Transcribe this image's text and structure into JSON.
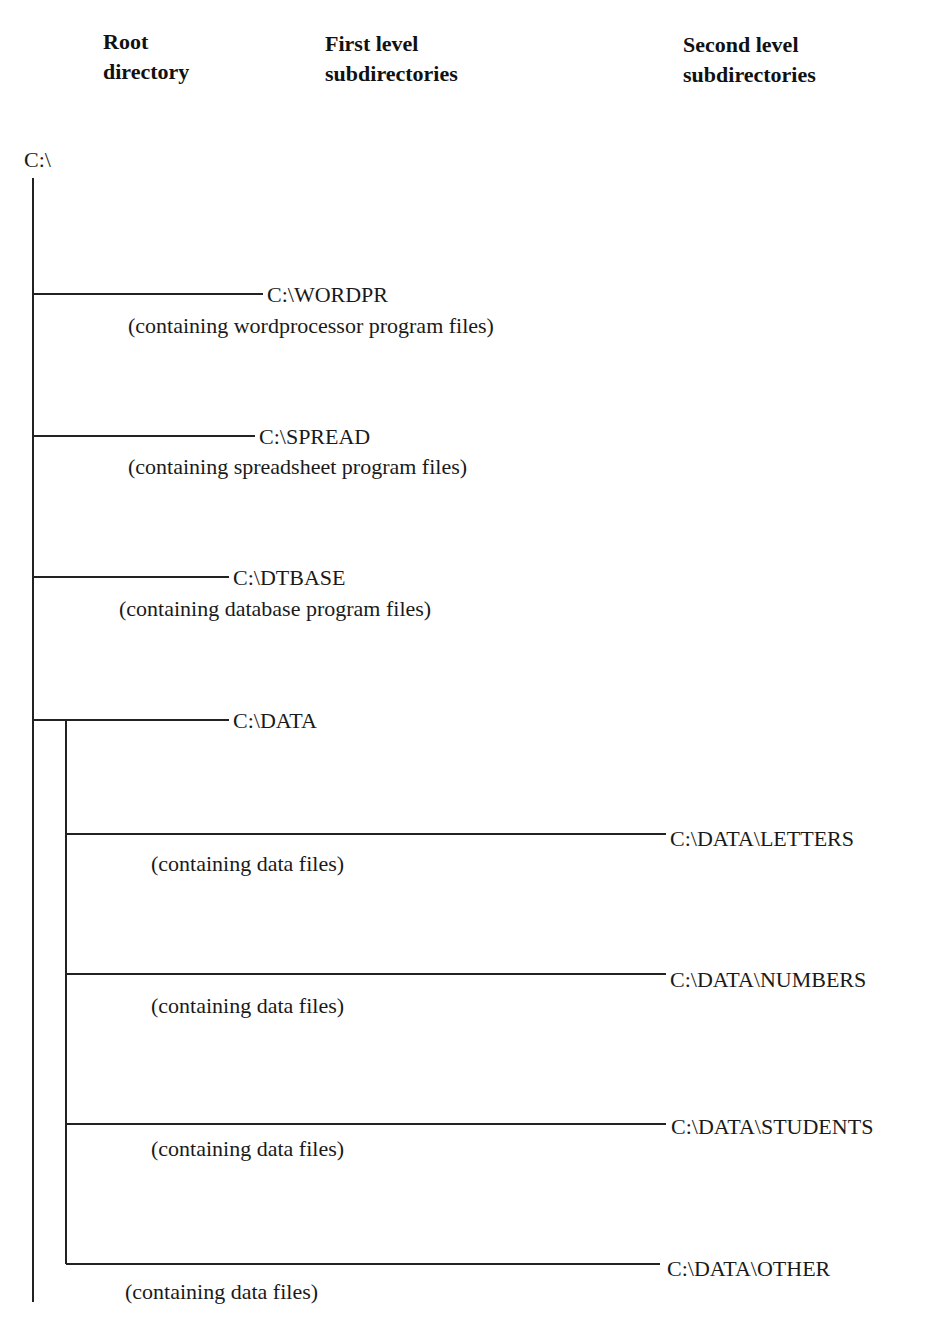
{
  "headers": {
    "root": {
      "line1": "Root",
      "line2": "directory"
    },
    "first": {
      "line1": "First level",
      "line2": "subdirectories"
    },
    "second": {
      "line1": "Second level",
      "line2": "subdirectories"
    }
  },
  "root": {
    "label": "C:\\"
  },
  "first_level": [
    {
      "label": "C:\\WORDPR",
      "desc": "(containing wordprocessor program files)"
    },
    {
      "label": "C:\\SPREAD",
      "desc": "(containing spreadsheet program files)"
    },
    {
      "label": "C:\\DTBASE",
      "desc": "(containing database program files)"
    },
    {
      "label": "C:\\DATA"
    }
  ],
  "second_level": [
    {
      "label": "C:\\DATA\\LETTERS",
      "desc": "(containing data files)"
    },
    {
      "label": "C:\\DATA\\NUMBERS",
      "desc": "(containing data files)"
    },
    {
      "label": "C:\\DATA\\STUDENTS",
      "desc": "(containing data files)"
    },
    {
      "label": "C:\\DATA\\OTHER",
      "desc": "(containing data files)"
    }
  ]
}
